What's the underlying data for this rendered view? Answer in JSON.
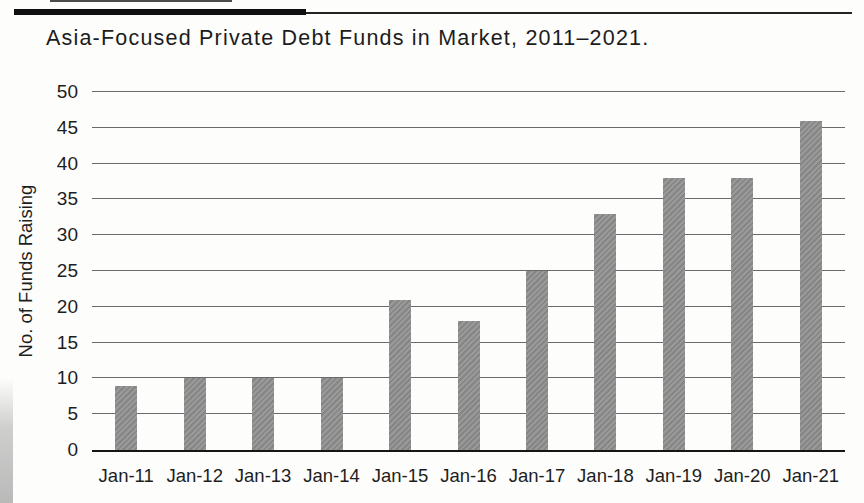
{
  "figure": {
    "title": "Asia-Focused Private Debt Funds in Market, 2011–2021."
  },
  "chart_data": {
    "type": "bar",
    "title": "Asia-Focused Private Debt Funds in Market, 2011–2021.",
    "categories": [
      "Jan-11",
      "Jan-12",
      "Jan-13",
      "Jan-14",
      "Jan-15",
      "Jan-16",
      "Jan-17",
      "Jan-18",
      "Jan-19",
      "Jan-20",
      "Jan-21"
    ],
    "values": [
      9,
      10,
      10,
      10,
      21,
      18,
      25,
      33,
      38,
      38,
      46
    ],
    "xlabel": "",
    "ylabel": "No. of Funds Raising",
    "ylim": [
      0,
      50
    ],
    "ytick_step": 5,
    "yticks": [
      0,
      5,
      10,
      15,
      20,
      25,
      30,
      35,
      40,
      45,
      50
    ],
    "grid": "horizontal",
    "legend": "none",
    "bar_color": "#909090",
    "gridline_color": "#6a6a6a",
    "axis_line_color": "#161616",
    "text_color": "#1d1d1d"
  }
}
